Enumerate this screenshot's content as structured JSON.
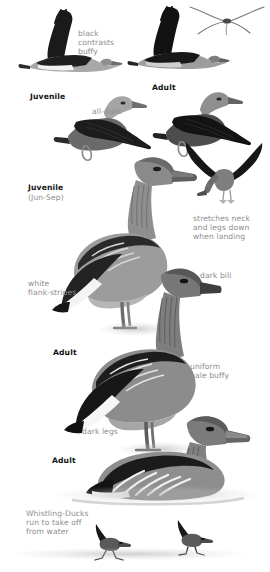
{
  "plate": {
    "title": "Whistling-Duck identification plate",
    "background_color": "#ffffff",
    "note_color": "#8d8d8d",
    "age_label_color": "#111111",
    "width": 270,
    "height": 572
  },
  "annotations": {
    "black_contrasts_buffy": "black\ncontrasts\nbuffy",
    "all_dark": "all-dark",
    "stretches_neck": "stretches neck\nand legs down\nwhen landing",
    "white_flank_stripes": "white\nflank-stripes",
    "dark_bill": "dark bill",
    "uniform_pale_buffy": "uniform\npale buffy",
    "dark_legs": "dark legs",
    "whistling_ducks_run": "Whistling-Ducks\nrun to take off\nfrom water"
  },
  "age_labels": {
    "juvenile_flight": "Juvenile",
    "adult_flight": "Adult",
    "juvenile_standing": "Juvenile",
    "juvenile_standing_season": "(Jun-Sep)",
    "adult_standing": "Adult",
    "adult_swimming": "Adult"
  },
  "figures": [
    {
      "name": "juvenile-upstroke-flight",
      "description": "Juvenile whistling-duck in flight, wings raised, black wings contrasting buffy body"
    },
    {
      "name": "adult-upstroke-flight",
      "description": "Adult whistling-duck in flight, wings raised, black underwing"
    },
    {
      "name": "distant-flight-silhouette",
      "description": "Distant flying whistling-duck outline, drooped neck and bowed wings"
    },
    {
      "name": "juvenile-downstroke-flight",
      "description": "Juvenile whistling-duck in flight, wings lowered, all-dark upperwing"
    },
    {
      "name": "adult-downstroke-flight",
      "description": "Adult whistling-duck in flight, wings lowered, all-dark upperwing"
    },
    {
      "name": "landing-bird",
      "description": "Whistling-duck landing with neck stretched and legs lowered"
    },
    {
      "name": "juvenile-standing",
      "description": "Standing juvenile whistling-duck, Jun-Sep, white flank stripes, dark legs"
    },
    {
      "name": "adult-standing",
      "description": "Standing adult whistling-duck, dark bill, uniform pale buffy body, dark legs"
    },
    {
      "name": "adult-swimming",
      "description": "Adult whistling-duck swimming on water"
    },
    {
      "name": "running-bird-left",
      "description": "Whistling-duck running across water to take off"
    },
    {
      "name": "running-bird-right",
      "description": "Whistling-duck running across water to take off"
    }
  ]
}
